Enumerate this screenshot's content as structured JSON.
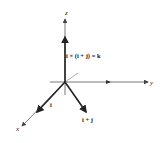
{
  "figure": {
    "axes": {
      "x_label": "x",
      "y_label": "y",
      "z_label": "z"
    },
    "vectors": {
      "i_label": "i",
      "i_plus_j_label": "i + j",
      "cross_product_label": "i × (i + j) = k"
    },
    "colors": {
      "axis": "#444444",
      "vector": "#222222",
      "background": "#ffffff"
    }
  }
}
